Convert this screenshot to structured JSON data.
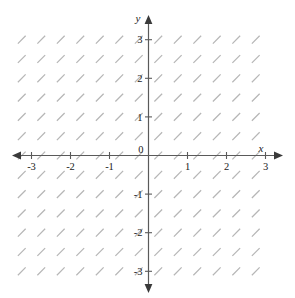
{
  "figure": {
    "title": "",
    "background_color": "#ffffff",
    "width": 295,
    "height": 298
  },
  "axes": {
    "x_axis_label": "x",
    "y_axis_label": "y",
    "origin_label": "0",
    "axis_color": "#5a5a5a",
    "label_color": "#1a1a1a",
    "x_tick_labels": [
      "-3",
      "-2",
      "-1",
      "1",
      "2",
      "3"
    ],
    "y_tick_labels": [
      "3",
      "2",
      "1",
      "-1",
      "-2",
      "-3"
    ]
  },
  "chart_data": {
    "type": "scatter",
    "plot_kind": "slope-field",
    "title": "",
    "xlabel": "x",
    "ylabel": "y",
    "xlim": [
      -3.5,
      3.5
    ],
    "ylim": [
      -3.5,
      3.5
    ],
    "grid": false,
    "legend": "none",
    "x_ticks": [
      -3,
      -2,
      -1,
      0,
      1,
      2,
      3
    ],
    "y_ticks": [
      -3,
      -2,
      -1,
      0,
      1,
      2,
      3
    ],
    "xtick_labels": [
      "-3",
      "-2",
      "-1",
      "0",
      "1",
      "2",
      "3"
    ],
    "ytick_labels": [
      "-3",
      "-2",
      "-1",
      "0",
      "1",
      "2",
      "3"
    ],
    "mark_color": "#b6b6b6",
    "mark_slope": 1,
    "mark_angle_degrees": 45,
    "mark_length_px": 11,
    "sample_spacing": 0.5,
    "sample_x_start": -3.25,
    "sample_x_end": 3.0,
    "sample_y_start": -3.0,
    "sample_y_end": 3.0,
    "series": [
      {
        "name": "slope segments",
        "slope_constant": 1,
        "values": []
      }
    ]
  }
}
